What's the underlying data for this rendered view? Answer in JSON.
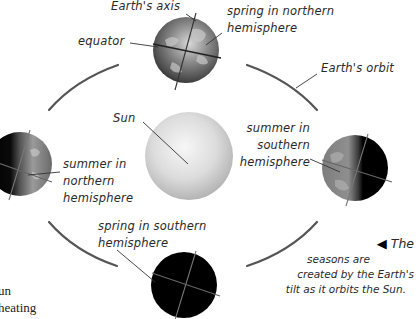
{
  "diagram": {
    "type": "seasons-orbit",
    "labels": {
      "earths_axis": "Earth's axis",
      "equator": "equator",
      "spring_north_1": "spring in northern",
      "spring_north_2": "hemisphere",
      "earths_orbit": "Earth's orbit",
      "sun": "Sun",
      "summer_south_1": "summer in",
      "summer_south_2": "southern",
      "summer_south_3": "hemisphere",
      "summer_north_1": "summer in",
      "summer_north_2": "northern",
      "summer_north_3": "hemisphere",
      "spring_south_1": "spring in southern",
      "spring_south_2": "hemisphere"
    },
    "caption": {
      "pointer": "◀",
      "line1": "The",
      "line2": "seasons are",
      "line3": "created by the Earth's",
      "line4": "tilt as it orbits the Sun."
    },
    "body_text_fragments": {
      "line1": "un",
      "line2": "heating"
    },
    "nodes": [
      {
        "id": "sun",
        "cx": 189,
        "cy": 156,
        "r": 44
      },
      {
        "id": "earth-top",
        "position": "spring-northern",
        "cx": 186,
        "cy": 50,
        "r": 33,
        "lit": "full"
      },
      {
        "id": "earth-right",
        "position": "summer-southern",
        "cx": 355,
        "cy": 168,
        "r": 33,
        "lit": "left-half"
      },
      {
        "id": "earth-left",
        "position": "summer-northern",
        "cx": 22,
        "cy": 165,
        "r": 33,
        "lit": "right-half"
      },
      {
        "id": "earth-bottom",
        "position": "spring-southern",
        "cx": 184,
        "cy": 285,
        "r": 33,
        "lit": "none"
      }
    ],
    "colors": {
      "background": "#ffffff",
      "orbit": "#555555",
      "text": "#2a2a2a",
      "dark_side": "#000000",
      "sun_light": "#f4f4f4",
      "sun_dark": "#b9b9b9"
    }
  }
}
